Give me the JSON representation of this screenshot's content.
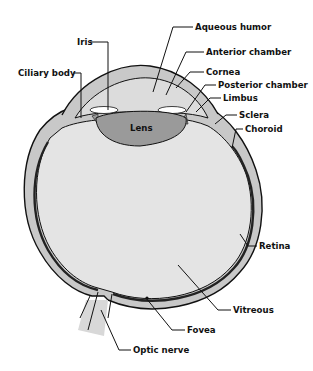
{
  "colors": {
    "sclera_fill": "#c8c8c8",
    "vitreous_fill": "#e4e4e4",
    "lens_fill": "#9a9a9a",
    "aqueous_fill": "#dcdcdc",
    "outline": "#111111",
    "background": "#ffffff"
  },
  "labels": {
    "iris": "Iris",
    "ciliary_body": "Ciliary body",
    "aqueous_humor": "Aqueous humor",
    "anterior_chamber": "Anterior chamber",
    "cornea": "Cornea",
    "posterior_chamber": "Posterior chamber",
    "limbus": "Limbus",
    "sclera": "Sclera",
    "choroid": "Choroid",
    "lens": "Lens",
    "retina": "Retina",
    "vitreous": "Vitreous",
    "fovea": "Fovea",
    "optic_nerve": "Optic nerve"
  }
}
